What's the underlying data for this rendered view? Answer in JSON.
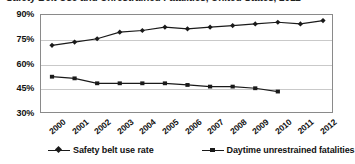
{
  "title": {
    "text": "Safety Belt Use and Unrestrained Fatalities, United States, 2012",
    "clipped": true
  },
  "chart_data": {
    "type": "line",
    "title": "Safety Belt Use and Unrestrained Fatalities, United States, 2012",
    "xlabel": "",
    "ylabel": "",
    "x": [
      2000,
      2001,
      2002,
      2003,
      2004,
      2005,
      2006,
      2007,
      2008,
      2009,
      2010,
      2011,
      2012
    ],
    "categories": [
      "2000",
      "2001",
      "2002",
      "2003",
      "2004",
      "2005",
      "2006",
      "2007",
      "2008",
      "2009",
      "2010",
      "2011",
      "2012"
    ],
    "ylim": [
      30,
      90
    ],
    "yticks": [
      30,
      45,
      60,
      75,
      90
    ],
    "ytick_labels": [
      "30%",
      "45%",
      "60%",
      "75%",
      "90%"
    ],
    "grid": true,
    "legend_position": "bottom",
    "series": [
      {
        "name": "Safety belt use rate",
        "marker": "diamond",
        "color": "#1a1a1a",
        "values": [
          71,
          73,
          75,
          79,
          80,
          82,
          81,
          82,
          83,
          84,
          85,
          84,
          86
        ]
      },
      {
        "name": "Daytime unrestrained fatalities",
        "marker": "square",
        "color": "#1a1a1a",
        "values": [
          52,
          51,
          48,
          48,
          48,
          48,
          47,
          46,
          46,
          45,
          43,
          null,
          null
        ]
      }
    ]
  },
  "legend": {
    "entries": [
      {
        "label": "Safety belt use rate",
        "marker": "diamond"
      },
      {
        "label": "Daytime unrestrained fatalities",
        "marker": "square"
      }
    ]
  },
  "colors": {
    "line": "#1a1a1a",
    "grid": "#c9c9c9",
    "frame": "#8a8a8a",
    "text": "#111111",
    "background": "#ffffff"
  }
}
